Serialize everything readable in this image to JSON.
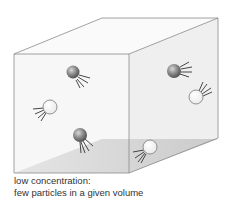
{
  "caption": {
    "line1": "low concentration:",
    "line2": "few particles in a given volume"
  },
  "colors": {
    "edge": "#8a8a8a",
    "front_face": "#f8f8f8",
    "right_face": "#eeeeee",
    "top_face": "#fafafa",
    "floor_light": "#e2e2e2",
    "floor_dark": "#c8c8c8",
    "dark_particle": "#6e6e6e",
    "light_particle": "#ffffff"
  },
  "particles": [
    {
      "type": "dark",
      "cx": 73,
      "cy": 73
    },
    {
      "type": "light",
      "cx": 50,
      "cy": 107
    },
    {
      "type": "dark",
      "cx": 80,
      "cy": 135
    },
    {
      "type": "dark",
      "cx": 174,
      "cy": 71
    },
    {
      "type": "light",
      "cx": 197,
      "cy": 97
    },
    {
      "type": "light",
      "cx": 150,
      "cy": 148
    }
  ]
}
